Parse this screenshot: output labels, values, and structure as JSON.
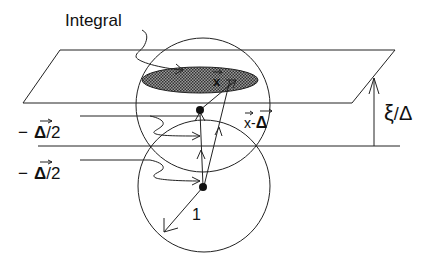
{
  "diagram": {
    "labels": {
      "integral": "Integral",
      "x_vec": "x",
      "x_minus_delta": "x-",
      "delta_symbol": "Δ",
      "minus_delta_half_upper_minus": "−",
      "minus_delta_half_upper_delta": "Δ",
      "minus_delta_half_upper_half": "/2",
      "minus_delta_half_lower_minus": "−",
      "minus_delta_half_lower_delta": "Δ",
      "minus_delta_half_lower_half": "/2",
      "unit_radius": "1",
      "xi": "ξ",
      "xi_slash": "/",
      "xi_delta": "Δ"
    },
    "colors": {
      "line": "#222222",
      "shade": "#555555",
      "background": "#ffffff"
    }
  }
}
